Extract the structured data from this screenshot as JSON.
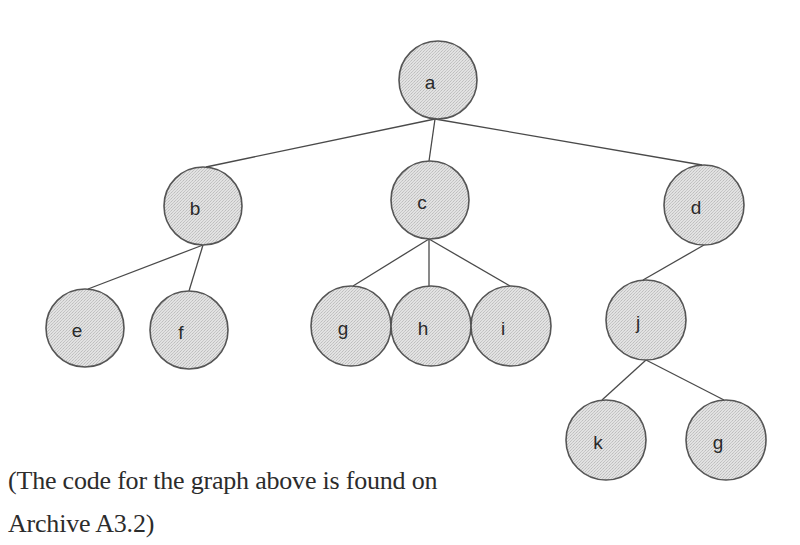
{
  "diagram": {
    "type": "tree",
    "node_fill": "#dcdcdc",
    "node_stroke": "#555555",
    "edge_color": "#4a4a4a",
    "nodes": [
      {
        "id": "a",
        "label": "a",
        "cx": 438,
        "cy": 80,
        "r": 39
      },
      {
        "id": "b",
        "label": "b",
        "cx": 203,
        "cy": 206,
        "r": 39
      },
      {
        "id": "c",
        "label": "c",
        "cx": 430,
        "cy": 200,
        "r": 39
      },
      {
        "id": "d",
        "label": "d",
        "cx": 704,
        "cy": 205,
        "r": 40
      },
      {
        "id": "e",
        "label": "e",
        "cx": 85,
        "cy": 328,
        "r": 39
      },
      {
        "id": "f",
        "label": "f",
        "cx": 189,
        "cy": 330,
        "r": 39
      },
      {
        "id": "g",
        "label": "g",
        "cx": 351,
        "cy": 326,
        "r": 40
      },
      {
        "id": "h",
        "label": "h",
        "cx": 431,
        "cy": 326,
        "r": 40
      },
      {
        "id": "i",
        "label": "i",
        "cx": 511,
        "cy": 326,
        "r": 40
      },
      {
        "id": "j",
        "label": "j",
        "cx": 646,
        "cy": 320,
        "r": 40
      },
      {
        "id": "k",
        "label": "k",
        "cx": 606,
        "cy": 440,
        "r": 40
      },
      {
        "id": "g2",
        "label": "g",
        "cx": 726,
        "cy": 440,
        "r": 40
      }
    ],
    "edges": [
      {
        "from": "a",
        "to": "b",
        "x1": 435,
        "y1": 119,
        "x2": 206,
        "y2": 167
      },
      {
        "from": "a",
        "to": "c",
        "x1": 435,
        "y1": 119,
        "x2": 429,
        "y2": 161
      },
      {
        "from": "a",
        "to": "d",
        "x1": 435,
        "y1": 119,
        "x2": 702,
        "y2": 165
      },
      {
        "from": "b",
        "to": "e",
        "x1": 203,
        "y1": 245,
        "x2": 88,
        "y2": 289
      },
      {
        "from": "b",
        "to": "f",
        "x1": 203,
        "y1": 245,
        "x2": 189,
        "y2": 291
      },
      {
        "from": "c",
        "to": "g",
        "x1": 429,
        "y1": 239,
        "x2": 353,
        "y2": 286
      },
      {
        "from": "c",
        "to": "h",
        "x1": 429,
        "y1": 239,
        "x2": 429,
        "y2": 286
      },
      {
        "from": "c",
        "to": "i",
        "x1": 429,
        "y1": 239,
        "x2": 510,
        "y2": 286
      },
      {
        "from": "d",
        "to": "j",
        "x1": 704,
        "y1": 245,
        "x2": 643,
        "y2": 280
      },
      {
        "from": "j",
        "to": "k",
        "x1": 646,
        "y1": 360,
        "x2": 602,
        "y2": 400
      },
      {
        "from": "j",
        "to": "g2",
        "x1": 646,
        "y1": 360,
        "x2": 724,
        "y2": 400
      }
    ]
  },
  "caption": {
    "line1": "(The code for the graph above is found on",
    "line2": "Archive A3.2)"
  }
}
